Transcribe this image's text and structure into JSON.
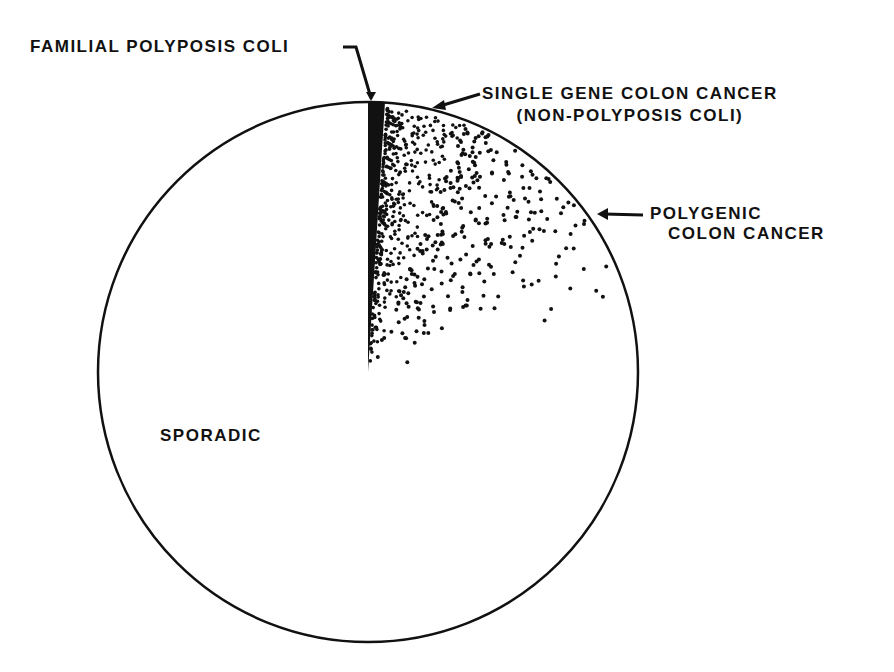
{
  "chart_data": {
    "type": "pie",
    "title": "",
    "categories": [
      "Familial Polyposis Coli",
      "Single Gene Colon Cancer (Non-Polyposis Coli)",
      "Polygenic Colon Cancer",
      "Sporadic"
    ],
    "values": [
      1,
      5,
      15,
      79
    ],
    "units": "approximate percent of colon cancer cases (schematic, unlabeled)",
    "fills": [
      "solid black",
      "dense dots",
      "sparse dots (gradient)",
      "white"
    ],
    "start_angle_deg": 0,
    "direction": "clockwise from 12 o'clock",
    "legend": "none (direct labels with leader lines)"
  },
  "labels": {
    "familial": "FAMILIAL POLYPOSIS COLI",
    "single_gene_line1": "SINGLE GENE COLON CANCER",
    "single_gene_line2": "(NON-POLYPOSIS COLI)",
    "polygenic_line1": "POLYGENIC",
    "polygenic_line2": "COLON CANCER",
    "sporadic": "SPORADIC"
  },
  "colors": {
    "ink": "#111111",
    "background": "#ffffff"
  }
}
